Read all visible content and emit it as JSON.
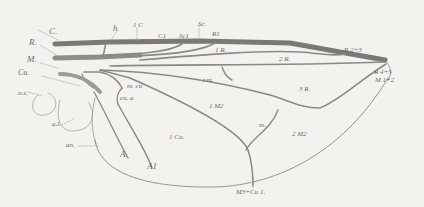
{
  "figure": {
    "colors": {
      "background": "#f3f2ef",
      "vein": "#8a8986",
      "costa": "#7a7976",
      "label": "#6b6a66"
    },
    "labels": {
      "C": "C.",
      "R": "R.",
      "M": "M.",
      "Cu": "Cu.",
      "os": "o.s.",
      "h": "h",
      "oneC": "1 C",
      "C1": "C1",
      "Sc1": "Sc1",
      "Sc": "Sc.",
      "R1": "R1",
      "oneR": "1 R.",
      "twoR": "2 R.",
      "threeR": "3 R.",
      "R23": "R 2+3",
      "R45": "R 4+5",
      "M12": "M 1+2",
      "mcu": "m. cu",
      "cua": "cu. a",
      "rm": "r.m.",
      "oneM": "1 M2",
      "twoM": "2 M2",
      "m": "m.",
      "oneCu": "1 Cu.",
      "al": "a.l.",
      "an": "an.",
      "A": "A.",
      "A1": "A1",
      "M3Cu1": "M3+Cu 1."
    }
  }
}
